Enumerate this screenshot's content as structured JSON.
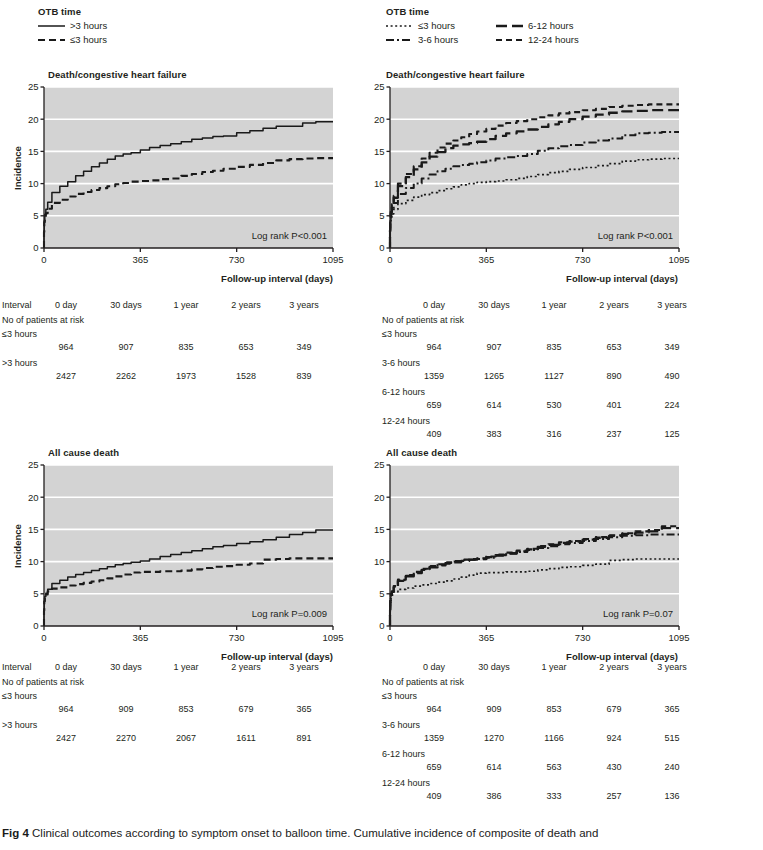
{
  "figure": {
    "caption_label": "Fig 4",
    "caption_text": " Clinical outcomes according to symptom onset to balloon time. Cumulative incidence of composite of death and"
  },
  "colors": {
    "plot_background": "#d3d3d3",
    "gridline": "#ffffff",
    "axis": "#231f20",
    "line": "#1a1a1a"
  },
  "legends": {
    "left": {
      "title": "OTB time",
      "items": [
        {
          "label": ">3 hours",
          "style": "solid"
        },
        {
          "label": "≤3 hours",
          "style": "dashed"
        }
      ]
    },
    "right": {
      "title": "OTB time",
      "items": [
        {
          "label": "≤3 hours",
          "style": "dotted"
        },
        {
          "label": "6-12 hours",
          "style": "longdash"
        },
        {
          "label": "3-6 hours",
          "style": "dashdot"
        },
        {
          "label": "12-24 hours",
          "style": "dash"
        }
      ]
    }
  },
  "axes": {
    "ylabel": "Incidence",
    "xlabel": "Follow-up interval (days)",
    "yticks": [
      "0",
      "5",
      "10",
      "15",
      "20",
      "25"
    ],
    "xticks": [
      "0",
      "365",
      "730",
      "1095"
    ],
    "ylim": [
      0,
      25
    ],
    "xlim": [
      0,
      1095
    ]
  },
  "chart_data": [
    {
      "id": "top-left",
      "type": "line",
      "title": "Death/congestive heart failure",
      "xlabel": "Follow-up interval (days)",
      "ylabel": "Incidence",
      "xlim": [
        0,
        1095
      ],
      "ylim": [
        0,
        25
      ],
      "grid": true,
      "annotation": "Log rank P<0.001",
      "x": [
        0,
        1,
        3,
        7,
        14,
        30,
        60,
        90,
        120,
        150,
        180,
        210,
        240,
        270,
        300,
        330,
        365,
        400,
        440,
        480,
        520,
        560,
        600,
        640,
        680,
        730,
        780,
        830,
        880,
        930,
        980,
        1030,
        1095
      ],
      "series": [
        {
          "name": ">3 hours",
          "style": "solid",
          "values": [
            0,
            2.6,
            4.2,
            5.2,
            6.0,
            7.1,
            8.6,
            9.6,
            10.3,
            11.2,
            11.9,
            12.6,
            13.2,
            13.8,
            14.3,
            14.6,
            14.8,
            15.2,
            15.6,
            15.9,
            16.2,
            16.5,
            16.9,
            17.1,
            17.3,
            17.4,
            17.9,
            18.2,
            18.6,
            18.9,
            18.9,
            19.4,
            19.6
          ]
        },
        {
          "name": "≤3 hours",
          "style": "dashed",
          "values": [
            0,
            2.5,
            4.0,
            4.8,
            5.4,
            6.1,
            7.0,
            7.5,
            8.0,
            8.4,
            8.7,
            9.0,
            9.3,
            9.6,
            9.9,
            10.1,
            10.3,
            10.4,
            10.5,
            10.7,
            10.8,
            11.2,
            11.5,
            11.8,
            12.0,
            12.3,
            12.6,
            12.9,
            13.2,
            13.6,
            13.8,
            13.9,
            13.95
          ]
        }
      ]
    },
    {
      "id": "top-right",
      "type": "line",
      "title": "Death/congestive heart failure",
      "xlabel": "Follow-up interval (days)",
      "ylabel": "Incidence",
      "xlim": [
        0,
        1095
      ],
      "ylim": [
        0,
        25
      ],
      "grid": true,
      "annotation": "Log rank P<0.001",
      "x": [
        0,
        1,
        3,
        7,
        14,
        30,
        60,
        90,
        120,
        150,
        180,
        210,
        240,
        270,
        300,
        330,
        365,
        400,
        440,
        480,
        520,
        560,
        600,
        640,
        680,
        730,
        780,
        830,
        880,
        930,
        980,
        1030,
        1095
      ],
      "series": [
        {
          "name": "≤3 hours",
          "style": "dotted",
          "values": [
            0,
            2.4,
            3.9,
            4.7,
            5.3,
            6.0,
            6.9,
            7.4,
            7.9,
            8.3,
            8.6,
            8.9,
            9.2,
            9.5,
            9.8,
            10.0,
            10.2,
            10.3,
            10.4,
            10.6,
            10.8,
            11.1,
            11.4,
            11.7,
            11.9,
            12.2,
            12.5,
            12.8,
            13.1,
            13.5,
            13.7,
            13.8,
            13.9
          ]
        },
        {
          "name": "3-6 hours",
          "style": "dashdot",
          "values": [
            0,
            2.6,
            4.2,
            5.2,
            6.0,
            7.0,
            8.4,
            9.3,
            10.0,
            10.8,
            11.4,
            11.9,
            12.3,
            12.7,
            12.9,
            13.1,
            13.3,
            13.6,
            13.9,
            14.1,
            14.3,
            14.6,
            15.1,
            15.5,
            15.8,
            16.0,
            16.4,
            16.7,
            17.0,
            17.5,
            17.8,
            17.9,
            18.0
          ]
        },
        {
          "name": "6-12 hours",
          "style": "longdash",
          "values": [
            0,
            2.7,
            4.4,
            5.6,
            6.5,
            7.8,
            9.6,
            11.0,
            12.2,
            13.3,
            14.2,
            14.9,
            15.5,
            15.9,
            16.1,
            16.3,
            16.5,
            16.9,
            17.4,
            17.8,
            18.1,
            18.4,
            18.8,
            19.2,
            19.6,
            20.0,
            20.4,
            20.7,
            21.0,
            21.2,
            21.3,
            21.4,
            21.4
          ]
        },
        {
          "name": "12-24 hours",
          "style": "dash",
          "values": [
            0,
            2.8,
            4.6,
            5.8,
            6.8,
            8.1,
            10.0,
            11.5,
            12.7,
            13.9,
            14.8,
            15.6,
            16.2,
            16.7,
            17.2,
            17.7,
            18.1,
            18.5,
            19.0,
            19.4,
            19.7,
            20.0,
            20.3,
            20.6,
            20.9,
            21.1,
            21.4,
            21.6,
            21.9,
            22.1,
            22.2,
            22.3,
            22.3
          ]
        }
      ]
    },
    {
      "id": "bottom-left",
      "type": "line",
      "title": "All cause death",
      "xlabel": "Follow-up interval (days)",
      "ylabel": "Incidence",
      "xlim": [
        0,
        1095
      ],
      "ylim": [
        0,
        25
      ],
      "grid": true,
      "annotation": "Log rank P=0.009",
      "x": [
        0,
        1,
        3,
        7,
        14,
        30,
        60,
        90,
        120,
        150,
        180,
        210,
        240,
        270,
        300,
        330,
        365,
        400,
        440,
        480,
        520,
        560,
        600,
        640,
        680,
        730,
        780,
        830,
        880,
        930,
        980,
        1030,
        1095
      ],
      "series": [
        {
          "name": ">3 hours",
          "style": "solid",
          "values": [
            0,
            2.5,
            3.9,
            4.6,
            5.1,
            5.7,
            6.6,
            7.1,
            7.6,
            8.0,
            8.3,
            8.6,
            8.9,
            9.2,
            9.5,
            9.7,
            9.9,
            10.1,
            10.4,
            10.8,
            11.1,
            11.4,
            11.7,
            12.0,
            12.3,
            12.5,
            12.8,
            13.1,
            13.4,
            13.8,
            14.2,
            14.5,
            14.9
          ]
        },
        {
          "name": "≤3 hours",
          "style": "dashed",
          "values": [
            0,
            2.4,
            3.8,
            4.5,
            4.9,
            5.4,
            5.8,
            6.0,
            6.3,
            6.5,
            6.7,
            6.9,
            7.1,
            7.4,
            7.7,
            8.0,
            8.3,
            8.4,
            8.4,
            8.5,
            8.5,
            8.6,
            8.8,
            9.0,
            9.2,
            9.3,
            9.5,
            9.7,
            10.3,
            10.4,
            10.5,
            10.5,
            10.5
          ]
        }
      ]
    },
    {
      "id": "bottom-right",
      "type": "line",
      "title": "All cause death",
      "xlabel": "Follow-up interval (days)",
      "ylabel": "Incidence",
      "xlim": [
        0,
        1095
      ],
      "ylim": [
        0,
        25
      ],
      "grid": true,
      "annotation": "Log rank P=0.07",
      "x": [
        0,
        1,
        3,
        7,
        14,
        30,
        60,
        90,
        120,
        150,
        180,
        210,
        240,
        270,
        300,
        330,
        365,
        400,
        440,
        480,
        520,
        560,
        600,
        640,
        680,
        730,
        780,
        830,
        880,
        930,
        980,
        1030,
        1095
      ],
      "series": [
        {
          "name": "≤3 hours",
          "style": "dotted",
          "values": [
            0,
            2.3,
            3.7,
            4.4,
            4.8,
            5.3,
            5.7,
            5.9,
            6.2,
            6.4,
            6.6,
            6.8,
            7.0,
            7.3,
            7.6,
            7.9,
            8.2,
            8.3,
            8.3,
            8.4,
            8.4,
            8.5,
            8.7,
            8.9,
            9.1,
            9.2,
            9.4,
            9.6,
            10.2,
            10.3,
            10.4,
            10.4,
            10.4
          ]
        },
        {
          "name": "3-6 hours",
          "style": "dashdot",
          "values": [
            0,
            2.6,
            4.1,
            4.9,
            5.4,
            6.1,
            7.1,
            7.8,
            8.3,
            8.8,
            9.2,
            9.5,
            9.8,
            10.0,
            10.2,
            10.3,
            10.4,
            10.6,
            10.9,
            11.2,
            11.5,
            11.8,
            12.1,
            12.4,
            12.7,
            12.9,
            13.2,
            13.5,
            13.8,
            14.0,
            14.1,
            14.2,
            14.2
          ]
        },
        {
          "name": "6-12 hours",
          "style": "longdash",
          "values": [
            0,
            2.4,
            3.9,
            4.8,
            5.3,
            6.0,
            7.0,
            7.7,
            8.2,
            8.7,
            9.1,
            9.4,
            9.7,
            9.9,
            10.1,
            10.3,
            10.4,
            10.7,
            11.0,
            11.3,
            11.6,
            11.9,
            12.3,
            12.6,
            12.9,
            13.1,
            13.4,
            13.7,
            14.0,
            14.3,
            14.5,
            14.7,
            15.2
          ]
        },
        {
          "name": "12-24 hours",
          "style": "dash",
          "values": [
            0,
            2.7,
            4.2,
            5.0,
            5.5,
            6.2,
            7.2,
            7.9,
            8.4,
            8.9,
            9.3,
            9.6,
            9.9,
            10.1,
            10.3,
            10.4,
            10.5,
            10.8,
            11.1,
            11.4,
            11.7,
            12.0,
            12.4,
            12.7,
            13.0,
            13.2,
            13.5,
            13.8,
            14.1,
            14.4,
            14.7,
            14.9,
            15.5
          ]
        }
      ]
    }
  ],
  "tables": {
    "top_left": {
      "interval_label": "Interval",
      "headers": [
        "0 day",
        "30 days",
        "1 year",
        "2 years",
        "3 years"
      ],
      "risk_label": "No of patients at risk",
      "rows": [
        {
          "label": "≤3 hours",
          "values": [
            "964",
            "907",
            "835",
            "653",
            "349"
          ]
        },
        {
          "label": ">3 hours",
          "values": [
            "2427",
            "2262",
            "1973",
            "1528",
            "839"
          ]
        }
      ]
    },
    "top_right": {
      "interval_label": "",
      "headers": [
        "0 day",
        "30 days",
        "1 year",
        "2 years",
        "3 years"
      ],
      "risk_label": "No of patients at risk",
      "rows": [
        {
          "label": "≤3 hours",
          "values": [
            "964",
            "907",
            "835",
            "653",
            "349"
          ]
        },
        {
          "label": "3-6 hours",
          "values": [
            "1359",
            "1265",
            "1127",
            "890",
            "490"
          ]
        },
        {
          "label": "6-12 hours",
          "values": [
            "659",
            "614",
            "530",
            "401",
            "224"
          ]
        },
        {
          "label": "12-24 hours",
          "values": [
            "409",
            "383",
            "316",
            "237",
            "125"
          ]
        }
      ]
    },
    "bottom_left": {
      "interval_label": "Interval",
      "headers": [
        "0 day",
        "30 days",
        "1 year",
        "2 years",
        "3 years"
      ],
      "risk_label": "No of patients at risk",
      "rows": [
        {
          "label": "≤3 hours",
          "values": [
            "964",
            "909",
            "853",
            "679",
            "365"
          ]
        },
        {
          "label": ">3 hours",
          "values": [
            "2427",
            "2270",
            "2067",
            "1611",
            "891"
          ]
        }
      ]
    },
    "bottom_right": {
      "interval_label": "",
      "headers": [
        "0 day",
        "30 days",
        "1 year",
        "2 years",
        "3 years"
      ],
      "risk_label": "No of patients at risk",
      "rows": [
        {
          "label": "≤3 hours",
          "values": [
            "964",
            "909",
            "853",
            "679",
            "365"
          ]
        },
        {
          "label": "3-6 hours",
          "values": [
            "1359",
            "1270",
            "1166",
            "924",
            "515"
          ]
        },
        {
          "label": "6-12 hours",
          "values": [
            "659",
            "614",
            "563",
            "430",
            "240"
          ]
        },
        {
          "label": "12-24 hours",
          "values": [
            "409",
            "386",
            "333",
            "257",
            "136"
          ]
        }
      ]
    }
  }
}
